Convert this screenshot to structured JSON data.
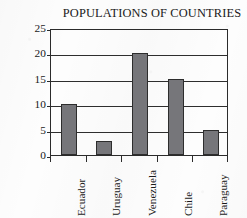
{
  "chart_data": {
    "type": "bar",
    "title": "POPULATIONS OF COUNTRIES",
    "xlabel": "",
    "ylabel": "Millions of People",
    "categories": [
      "Ecuador",
      "Uruguay",
      "Venezuela",
      "Chile",
      "Paraguay"
    ],
    "values": [
      10,
      2.8,
      20,
      15,
      5
    ],
    "ylim": [
      0,
      25
    ],
    "ytick_labels": [
      "0",
      "5",
      "10",
      "15",
      "20",
      "25"
    ],
    "ytick_values": [
      0,
      5,
      10,
      15,
      20,
      25
    ],
    "grid": "horizontal",
    "legend": "none",
    "bar_color": "#76767a",
    "bar_edge_color": "#2d2d2d",
    "axis_color": "#2b2b2b",
    "background_color": "#fdfdfd"
  }
}
